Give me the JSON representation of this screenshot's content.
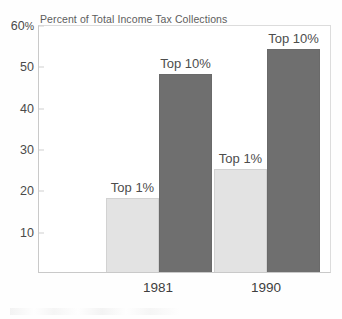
{
  "chart_data": {
    "type": "bar",
    "title": "Percent of Total Income Tax Collections",
    "xlabel": "",
    "ylabel": "",
    "categories": [
      "1981",
      "1990"
    ],
    "series": [
      {
        "name": "Top 1%",
        "values": [
          18,
          25
        ],
        "color": "#e3e3e3"
      },
      {
        "name": "Top 10%",
        "values": [
          48,
          54
        ],
        "color": "#6f6f6f"
      }
    ],
    "ylim": [
      0,
      60
    ],
    "yticks": [
      10,
      20,
      30,
      40,
      50,
      60
    ],
    "ytick_labels": [
      "10",
      "20",
      "30",
      "40",
      "50",
      "60%"
    ],
    "grid": false,
    "legend": "none",
    "bar_labels": [
      {
        "text": "Top 1%",
        "category": "1981",
        "value": 18
      },
      {
        "text": "Top 10%",
        "category": "1981",
        "value": 48
      },
      {
        "text": "Top 1%",
        "category": "1990",
        "value": 25
      },
      {
        "text": "Top 10%",
        "category": "1990",
        "value": 54
      }
    ]
  },
  "axis": {
    "y_ticks": [
      {
        "label": "60",
        "suffix": "%",
        "value": 60
      },
      {
        "label": "50",
        "suffix": "",
        "value": 50
      },
      {
        "label": "40",
        "suffix": "",
        "value": 40
      },
      {
        "label": "30",
        "suffix": "",
        "value": 30
      },
      {
        "label": "20",
        "suffix": "",
        "value": 20
      },
      {
        "label": "10",
        "suffix": "",
        "value": 10
      }
    ],
    "x_labels": [
      "1981",
      "1990"
    ]
  }
}
